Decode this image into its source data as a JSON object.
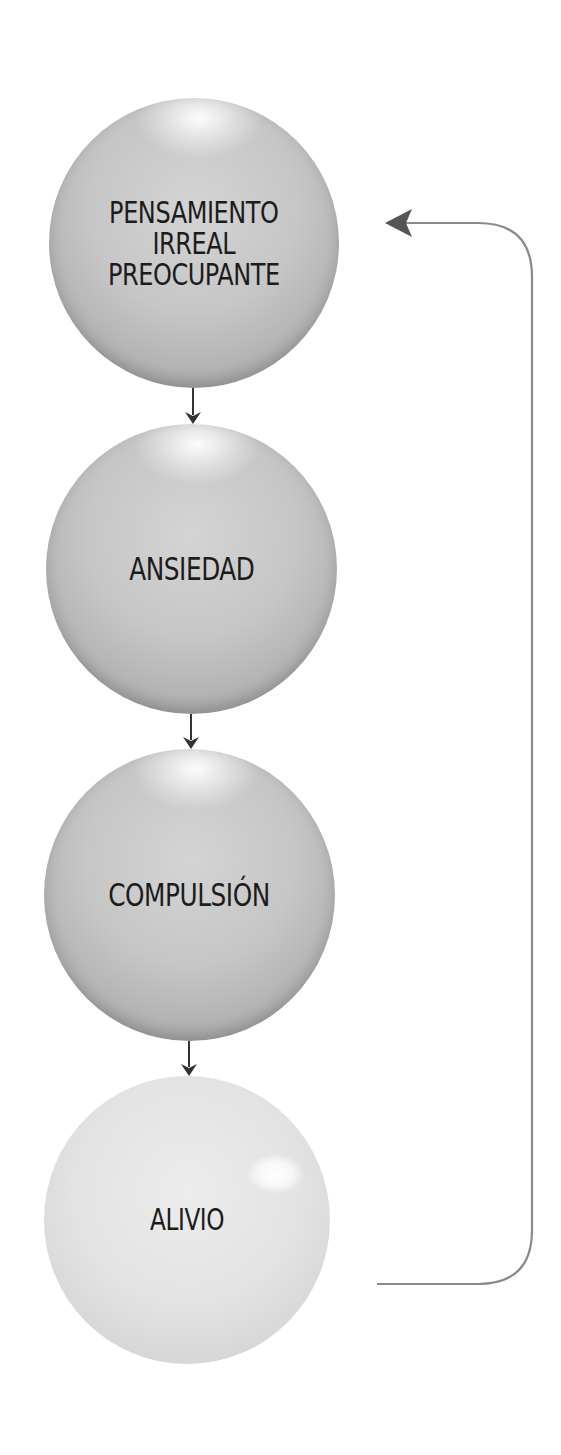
{
  "diagram": {
    "type": "cycle-flow",
    "nodes": [
      {
        "id": "n1",
        "lines": [
          "PENSAMIENTO",
          "IRREAL",
          "PREOCUPANTE"
        ],
        "tone": "dark"
      },
      {
        "id": "n2",
        "lines": [
          "ANSIEDAD"
        ],
        "tone": "dark"
      },
      {
        "id": "n3",
        "lines": [
          "COMPULSIÓN"
        ],
        "tone": "dark"
      },
      {
        "id": "n4",
        "lines": [
          "ALIVIO"
        ],
        "tone": "light"
      }
    ],
    "edges": [
      {
        "from": "n1",
        "to": "n2"
      },
      {
        "from": "n2",
        "to": "n3"
      },
      {
        "from": "n3",
        "to": "n4"
      },
      {
        "from": "n4",
        "to": "n1",
        "style": "feedback-loop"
      }
    ],
    "colors": {
      "arrow_dark": "#333333",
      "feedback_line": "#8a8a8a",
      "sphere_dark": "#c4c4c4",
      "sphere_light": "#e2e2e2",
      "text": "#1c1c1c"
    }
  }
}
